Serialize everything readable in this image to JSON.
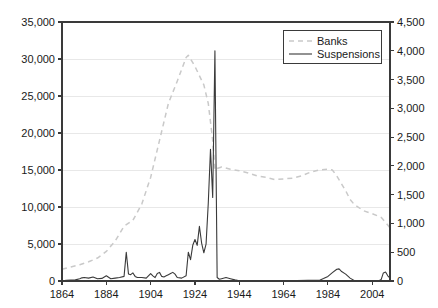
{
  "chart_data": {
    "type": "line",
    "title": "",
    "xlabel": "",
    "ylabel": "",
    "y2label": "",
    "grid": true,
    "legend_position": "top-right",
    "xlim": [
      1864,
      2012
    ],
    "ylim": [
      0,
      35000
    ],
    "y2lim": [
      0,
      4500
    ],
    "xticks": [
      1864,
      1884,
      1904,
      1924,
      1944,
      1964,
      1984,
      2004
    ],
    "xtick_labels": [
      "1864",
      "1884",
      "1904",
      "1924",
      "1944",
      "1964",
      "1984",
      "2004"
    ],
    "yticks": [
      0,
      5000,
      10000,
      15000,
      20000,
      25000,
      30000,
      35000
    ],
    "ytick_labels": [
      "0",
      "5,000",
      "10,000",
      "15,000",
      "20,000",
      "25,000",
      "30,000",
      "35,000"
    ],
    "y2ticks": [
      0,
      500,
      1000,
      1500,
      2000,
      2500,
      3000,
      3500,
      4000,
      4500
    ],
    "y2tick_labels": [
      "0",
      "500",
      "1,000",
      "1,500",
      "2,000",
      "2,500",
      "3,000",
      "3,500",
      "4,000",
      "4,500"
    ],
    "legend": [
      "Banks",
      "Suspensions"
    ],
    "colors": {
      "banks": "#c9c9c9",
      "suspensions": "#3a3a3a",
      "axis": "#3a3a3a",
      "grid": "#e8e8e8",
      "background": "#ffffff"
    },
    "series": [
      {
        "name": "Banks",
        "axis": "left",
        "style": "dashed",
        "color": "#c9c9c9",
        "x": [
          1864,
          1868,
          1872,
          1876,
          1880,
          1884,
          1888,
          1892,
          1896,
          1900,
          1904,
          1908,
          1912,
          1916,
          1920,
          1921,
          1924,
          1928,
          1930,
          1932,
          1933,
          1934,
          1936,
          1940,
          1944,
          1948,
          1952,
          1956,
          1960,
          1964,
          1968,
          1972,
          1976,
          1980,
          1984,
          1986,
          1988,
          1990,
          1992,
          1994,
          1996,
          2000,
          2004,
          2008,
          2012
        ],
        "values": [
          1600,
          1900,
          2200,
          2600,
          3100,
          4000,
          5400,
          7400,
          8200,
          10400,
          14000,
          19000,
          24000,
          27000,
          30200,
          30500,
          29000,
          26500,
          24000,
          19000,
          15000,
          15200,
          15400,
          15100,
          14900,
          14600,
          14200,
          14000,
          13700,
          13800,
          13900,
          14200,
          14700,
          15000,
          15100,
          15000,
          14200,
          13200,
          12200,
          11000,
          10300,
          9500,
          9100,
          8600,
          7200
        ]
      },
      {
        "name": "Suspensions",
        "axis": "right",
        "style": "solid",
        "color": "#3a3a3a",
        "x": [
          1864,
          1866,
          1868,
          1870,
          1872,
          1873,
          1874,
          1876,
          1878,
          1880,
          1882,
          1884,
          1886,
          1888,
          1890,
          1892,
          1893,
          1894,
          1895,
          1896,
          1897,
          1898,
          1900,
          1902,
          1904,
          1905,
          1906,
          1907,
          1908,
          1909,
          1910,
          1911,
          1912,
          1913,
          1914,
          1915,
          1916,
          1918,
          1920,
          1921,
          1922,
          1923,
          1924,
          1925,
          1926,
          1927,
          1928,
          1929,
          1930,
          1931,
          1932,
          1933,
          1934,
          1935,
          1936,
          1938,
          1940,
          1942,
          1944,
          1946,
          1950,
          1955,
          1960,
          1965,
          1970,
          1975,
          1980,
          1982,
          1984,
          1986,
          1988,
          1989,
          1990,
          1992,
          1994,
          1996,
          2000,
          2004,
          2007,
          2008,
          2009,
          2010,
          2011,
          2012
        ],
        "values": [
          5,
          10,
          15,
          20,
          40,
          55,
          60,
          50,
          70,
          40,
          45,
          90,
          40,
          50,
          60,
          80,
          500,
          120,
          110,
          140,
          80,
          60,
          60,
          50,
          130,
          90,
          60,
          130,
          150,
          80,
          70,
          90,
          110,
          130,
          150,
          120,
          60,
          50,
          90,
          500,
          370,
          620,
          720,
          620,
          950,
          660,
          490,
          640,
          1350,
          2290,
          1450,
          4000,
          60,
          30,
          40,
          60,
          40,
          20,
          2,
          1,
          4,
          4,
          2,
          5,
          8,
          13,
          10,
          42,
          80,
          145,
          205,
          210,
          170,
          120,
          50,
          6,
          2,
          4,
          3,
          25,
          140,
          155,
          90,
          50
        ]
      }
    ],
    "annotations": [
      {
        "label": "Panic of 1893 spike",
        "x": 1893,
        "series": "Suspensions",
        "value": 500
      },
      {
        "label": "Great Depression peak",
        "x": 1933,
        "series": "Suspensions",
        "value": 4000
      },
      {
        "label": "Banks peak",
        "x": 1921,
        "series": "Banks",
        "value": 30500
      },
      {
        "label": "S&L crisis",
        "x": 1989,
        "series": "Suspensions",
        "value": 205
      }
    ]
  }
}
